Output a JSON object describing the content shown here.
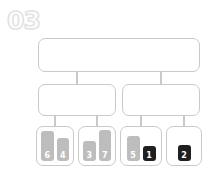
{
  "step": {
    "label": "03"
  },
  "diagram": {
    "type": "hierarchy-tree",
    "accent_gray": "#bdbdbd",
    "accent_dark": "#1f1f1f",
    "border_color": "#c9c9c9",
    "root": {
      "label": ""
    },
    "mid_nodes": [
      {
        "label": ""
      },
      {
        "label": ""
      }
    ],
    "leaves": [
      {
        "chips": [
          {
            "value": "6",
            "height": 30,
            "style": "gray"
          },
          {
            "value": "4",
            "height": 23,
            "style": "gray"
          }
        ]
      },
      {
        "chips": [
          {
            "value": "3",
            "height": 20,
            "style": "gray"
          },
          {
            "value": "7",
            "height": 31,
            "style": "gray"
          }
        ]
      },
      {
        "chips": [
          {
            "value": "5",
            "height": 25,
            "style": "gray"
          },
          {
            "value": "1",
            "height": 15,
            "style": "dark"
          }
        ]
      },
      {
        "chips": [
          {
            "value": "2",
            "height": 16,
            "style": "dark"
          }
        ]
      }
    ]
  }
}
